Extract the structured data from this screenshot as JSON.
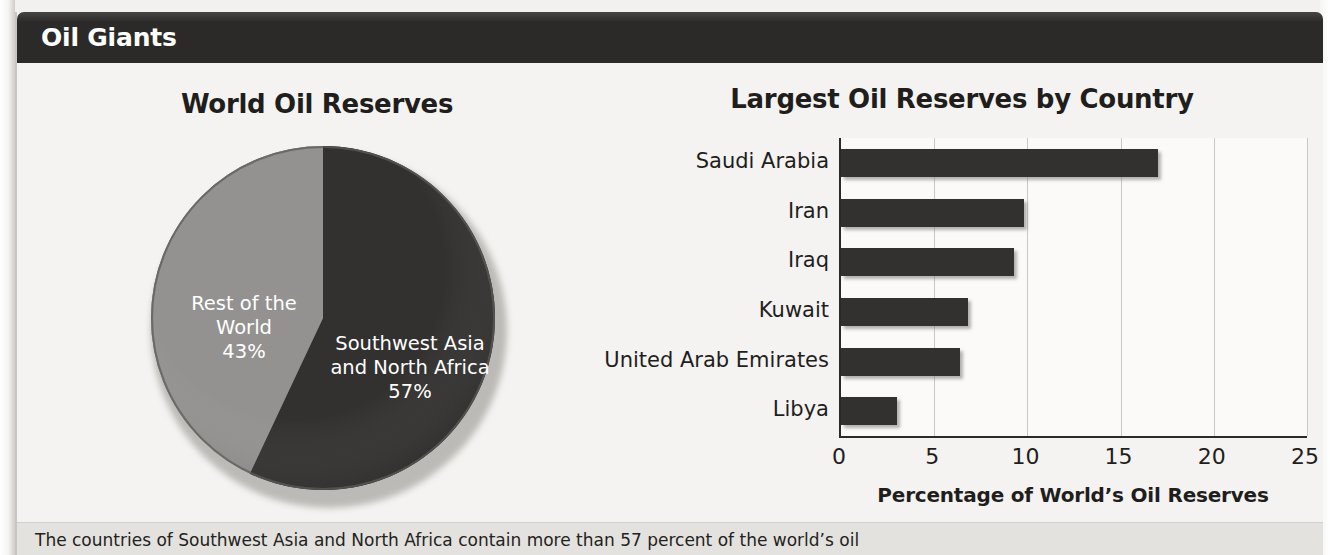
{
  "feature": {
    "header_title": "Oil Giants",
    "caption": "The countries of Southwest Asia and North Africa contain more than 57 percent of the world’s oil"
  },
  "chart_data": [
    {
      "type": "pie",
      "title": "World Oil Reserves",
      "labels": [
        "Southwest Asia and North Africa",
        "Rest of the World"
      ],
      "values": [
        57,
        43
      ],
      "value_suffix": "%",
      "colors": [
        "#323130",
        "#949290"
      ],
      "slice_labels": [
        {
          "name": "Southwest Asia and North Africa",
          "line1": "Southwest Asia",
          "line2": "and North Africa",
          "value_text": "57%"
        },
        {
          "name": "Rest of the World",
          "line1": "Rest of the",
          "line2": "World",
          "value_text": "43%"
        }
      ],
      "legend": "none",
      "start_angle_deg": 0
    },
    {
      "type": "bar",
      "orientation": "horizontal",
      "title": "Largest Oil Reserves by Country",
      "categories": [
        "Saudi Arabia",
        "Iran",
        "Iraq",
        "Kuwait",
        "United Arab Emirates",
        "Libya"
      ],
      "values": [
        17.0,
        9.8,
        9.3,
        6.8,
        6.4,
        3.0
      ],
      "xlabel": "Percentage of World’s Oil Reserves",
      "ylabel": "",
      "xlim": [
        0,
        25
      ],
      "xticks": [
        0,
        5,
        10,
        15,
        20,
        25
      ],
      "xtick_labels": [
        "0",
        "5",
        "10",
        "15",
        "20",
        "25"
      ],
      "grid": "vertical",
      "bar_color": "#323130"
    }
  ]
}
